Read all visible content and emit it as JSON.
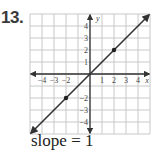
{
  "problem_number": "13.",
  "caption": "slope = 1",
  "chart_data": {
    "type": "line",
    "title": "",
    "xlabel": "x",
    "ylabel": "y",
    "xlim": [
      -5,
      5
    ],
    "ylim": [
      -5,
      5
    ],
    "grid": true,
    "x_tick_labels": [
      "-4",
      "-3",
      "-2",
      "1",
      "2",
      "3",
      "4"
    ],
    "x_tick_values": [
      -4,
      -3,
      -2,
      1,
      2,
      3,
      4
    ],
    "y_tick_labels": [
      "4",
      "3",
      "2",
      "1",
      "-2",
      "-3",
      "-4"
    ],
    "y_tick_values": [
      4,
      3,
      2,
      1,
      -2,
      -3,
      -4
    ],
    "series": [
      {
        "name": "y = x",
        "slope": 1,
        "intercept": 0,
        "x": [
          -5,
          5
        ],
        "y": [
          -5,
          5
        ],
        "arrows": "both"
      }
    ],
    "points": [
      {
        "x": 2,
        "y": 2
      },
      {
        "x": -2,
        "y": -2
      }
    ],
    "colors": {
      "line": "#333333",
      "grid": "#c8c8c8",
      "axis": "#333333"
    }
  }
}
